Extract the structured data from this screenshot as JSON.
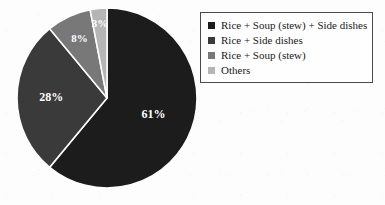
{
  "background_color": "#fdfdfd",
  "chart_data": {
    "type": "pie",
    "title": "",
    "subtitle": "",
    "xlabel": "",
    "ylabel": "",
    "grid": false,
    "legend_position": "right",
    "units": "percent",
    "start_angle_deg": 0,
    "direction": "clockwise",
    "categories": [
      "Rice + Soup (stew) + Side dishes",
      "Rice + Side dishes",
      "Rice + Soup (stew)",
      "Others"
    ],
    "values": [
      61,
      28,
      8,
      3
    ],
    "data_labels": [
      "61%",
      "28%",
      "8%",
      "3%"
    ],
    "colors": [
      "#1c1c1c",
      "#3a3a3a",
      "#787878",
      "#b5b5b5"
    ],
    "slices": [
      {
        "label": "Rice + Soup (stew) + Side dishes",
        "value": 61,
        "data_label": "61%",
        "color": "#1c1c1c",
        "label_color": "#ffffff"
      },
      {
        "label": "Rice + Side dishes",
        "value": 28,
        "data_label": "28%",
        "color": "#3a3a3a",
        "label_color": "#ffffff"
      },
      {
        "label": "Rice + Soup (stew)",
        "value": 8,
        "data_label": "8%",
        "color": "#787878",
        "label_color": "#ffffff"
      },
      {
        "label": "Others",
        "value": 3,
        "data_label": "3%",
        "color": "#b5b5b5",
        "label_color": "#ffffff"
      }
    ]
  },
  "legend": {
    "border_color": "#4a4a4a",
    "items": [
      {
        "label": "Rice + Soup (stew) + Side dishes",
        "color": "#1c1c1c"
      },
      {
        "label": "Rice + Side dishes",
        "color": "#3a3a3a"
      },
      {
        "label": "Rice + Soup (stew)",
        "color": "#787878"
      },
      {
        "label": "Others",
        "color": "#b5b5b5"
      }
    ]
  }
}
